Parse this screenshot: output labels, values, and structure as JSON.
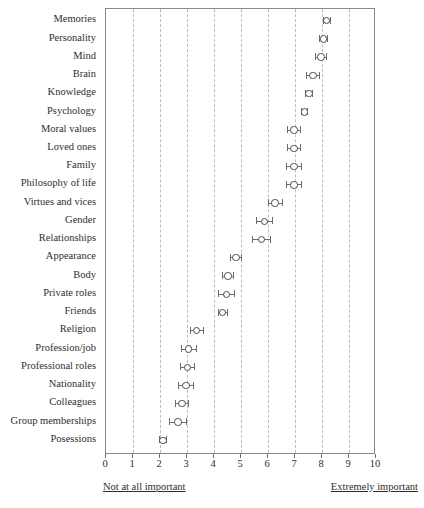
{
  "chart_data": {
    "type": "scatter",
    "title": "",
    "subtitle": "",
    "xlabel": "",
    "ylabel": "",
    "xlim": [
      0,
      10
    ],
    "xticks": [
      0,
      1,
      2,
      3,
      4,
      5,
      6,
      7,
      8,
      9,
      10
    ],
    "xtick_labels": [
      "0",
      "1",
      "2",
      "3",
      "4",
      "5",
      "6",
      "7",
      "8",
      "9",
      "10"
    ],
    "grid": "vertical dashed gridlines at every integer tick",
    "legend": "none",
    "orientation": "horizontal dot plot with error bars, categories sorted descending by mean",
    "axis_anchor_left": "Not at all important",
    "axis_anchor_right": "Extremely important",
    "marker_style": "open circle",
    "errorbar_style": "horizontal line with end caps",
    "categories": [
      "Memories",
      "Personality",
      "Mind",
      "Brain",
      "Knowledge",
      "Psychology",
      "Moral values",
      "Loved ones",
      "Family",
      "Philosophy of life",
      "Virtues and vices",
      "Gender",
      "Relationships",
      "Appearance",
      "Body",
      "Private roles",
      "Friends",
      "Religion",
      "Profession/job",
      "Professional roles",
      "Nationality",
      "Colleagues",
      "Group memberships",
      "Posessions"
    ],
    "values": [
      8.15,
      8.05,
      7.95,
      7.65,
      7.5,
      7.35,
      6.95,
      6.95,
      6.95,
      6.95,
      6.25,
      5.85,
      5.75,
      4.8,
      4.5,
      4.45,
      4.3,
      3.35,
      3.05,
      3.0,
      2.95,
      2.8,
      2.65,
      2.1
    ],
    "error_low": [
      8.02,
      7.9,
      7.75,
      7.4,
      7.38,
      7.24,
      6.7,
      6.7,
      6.68,
      6.68,
      6.0,
      5.55,
      5.42,
      4.6,
      4.3,
      4.15,
      4.13,
      3.1,
      2.78,
      2.75,
      2.68,
      2.55,
      2.35,
      1.97
    ],
    "error_high": [
      8.28,
      8.2,
      8.15,
      7.9,
      7.62,
      7.46,
      7.2,
      7.2,
      7.22,
      7.22,
      6.5,
      6.15,
      6.08,
      5.0,
      4.7,
      4.75,
      4.47,
      3.6,
      3.32,
      3.25,
      3.22,
      3.05,
      2.95,
      2.23
    ],
    "series": [
      {
        "name": "Mean importance rating",
        "values": [
          8.15,
          8.05,
          7.95,
          7.65,
          7.5,
          7.35,
          6.95,
          6.95,
          6.95,
          6.95,
          6.25,
          5.85,
          5.75,
          4.8,
          4.5,
          4.45,
          4.3,
          3.35,
          3.05,
          3.0,
          2.95,
          2.8,
          2.65,
          2.1
        ]
      }
    ]
  },
  "colors": {
    "frame": "#8a8a8a",
    "gridline": "#bdbdbd",
    "marker": "#4a4a4a",
    "errorbar": "#6d6d6d",
    "text": "#2e2e2e",
    "background": "#ffffff"
  }
}
